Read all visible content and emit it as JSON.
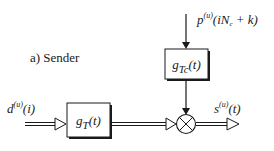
{
  "diagram": {
    "title": "a) Sender",
    "input_signal": {
      "base": "d",
      "sup": "(u)",
      "arg": "(i)"
    },
    "spreading_input": {
      "base": "p",
      "sup": "(u)",
      "arg": "(iN",
      "arg_sub": "c",
      "arg_tail": " + k)"
    },
    "output_signal": {
      "base": "s",
      "sup": "(u)",
      "arg": "(t)"
    },
    "blocks": [
      {
        "id": "transmit-filter",
        "base": "g",
        "sub": "T",
        "arg": "(t)"
      },
      {
        "id": "chip-filter",
        "base": "g",
        "sub": "Tc",
        "arg": "(t)"
      }
    ],
    "multiplier_symbol": "⊗",
    "colors": {
      "line": "#1a1a1a",
      "box_fill": "#ffffff",
      "shadow": "#1a1a1a"
    }
  }
}
